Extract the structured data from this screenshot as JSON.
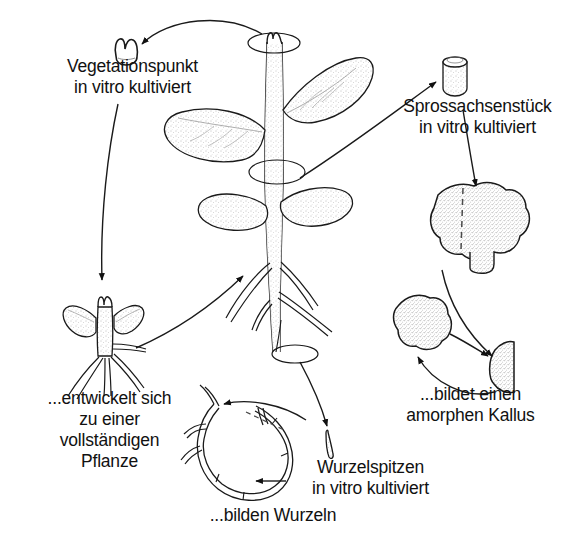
{
  "figure": {
    "language": "de",
    "background_color": "#ffffff",
    "ink_color": "#111111",
    "style": "hand-drawn pen-and-ink line illustration, stippled shading"
  },
  "labels": {
    "vegetationspunkt": {
      "line1": "Vegetationspunkt",
      "line2": "in vitro kultiviert"
    },
    "sprossachsenstueck": {
      "line1": "Sprossachsenstück",
      "line2": "in vitro kultiviert"
    },
    "pflanze": {
      "line1": "...entwickelt sich",
      "line2": "zu einer",
      "line3": "vollständigen",
      "line4": "Pflanze"
    },
    "kallus": {
      "line1": "...bildet einen",
      "line2": "amorphen Kallus"
    },
    "wurzelspitzen": {
      "line1": "Wurzelspitzen",
      "line2": "in vitro kultiviert"
    },
    "wurzeln": {
      "line1": "...bilden Wurzeln"
    }
  },
  "diagram_elements": {
    "central_plant": "whole plant with upright stem, four leaves, shoot apex at top, tap root with lateral roots below",
    "excision_markers": [
      "ellipse around shoot apex (top of stem)",
      "ellipse around mid stem segment",
      "ellipse around root tip (bottom)"
    ],
    "explant_shoot_apex": "small meristem / shoot apex dome, top left",
    "explant_stem_cylinder": "short cylindrical stem segment, top right",
    "explant_root_tip": "small root tip fragment, bottom centre right",
    "plantlet": "regenerated small plantlet with two leaves and roots, lower left",
    "callus_large": "large amorphous callus mass with dashed cut line, right",
    "callus_second": "second amorphous callus mass, lower right",
    "callus_fragment": "wedge-shaped callus subculture fragment, lower right",
    "root_culture": "looped branching root culture in vitro with dashed cut line, bottom centre"
  },
  "arrows": [
    {
      "from": "shoot apex of plant",
      "to": "explant shoot apex",
      "kind": "curved"
    },
    {
      "from": "explant shoot apex label",
      "to": "plantlet",
      "kind": "curved"
    },
    {
      "from": "plantlet",
      "to": "central plant",
      "kind": "curved"
    },
    {
      "from": "mid stem segment of plant",
      "to": "explant stem cylinder",
      "kind": "straight"
    },
    {
      "from": "explant stem cylinder",
      "to": "callus large",
      "kind": "straight"
    },
    {
      "from": "callus large",
      "to": "callus fragment",
      "kind": "curved"
    },
    {
      "from": "callus second",
      "to": "callus fragment",
      "kind": "straight"
    },
    {
      "from": "callus fragment",
      "to": "callus second",
      "kind": "curved"
    },
    {
      "from": "root tip of plant",
      "to": "explant root tip",
      "kind": "curved"
    },
    {
      "from": "explant root tip",
      "to": "root culture",
      "kind": "curved"
    },
    {
      "from": "root culture label",
      "to": "root culture",
      "kind": "straight"
    }
  ]
}
